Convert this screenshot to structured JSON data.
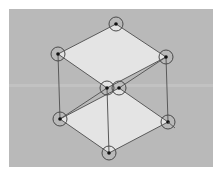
{
  "diagram": {
    "type": "cube-wireframe-editor",
    "colors": {
      "background": "#b9b9b9",
      "face_fill": "#e4e4e4",
      "edge": "#5a5a5a",
      "handle_ring": "#4a4a4a",
      "handle_dot": "#111111"
    },
    "vertices": [
      {
        "id": "top",
        "x": 116,
        "y": 24
      },
      {
        "id": "upper-left",
        "x": 58,
        "y": 54
      },
      {
        "id": "upper-right",
        "x": 166,
        "y": 57
      },
      {
        "id": "upper-front",
        "x": 107,
        "y": 88
      },
      {
        "id": "lower-back",
        "x": 119,
        "y": 88
      },
      {
        "id": "lower-left",
        "x": 60,
        "y": 119
      },
      {
        "id": "lower-right",
        "x": 168,
        "y": 122
      },
      {
        "id": "bottom",
        "x": 109,
        "y": 153
      }
    ]
  }
}
